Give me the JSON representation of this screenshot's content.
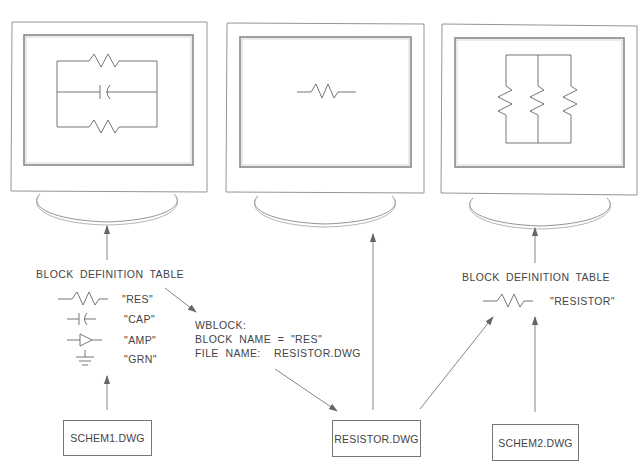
{
  "diagram": {
    "monitors": [
      {
        "id": "monitor-schem1",
        "screen_content": "parallel-circuit-2-resistors-1-capacitor"
      },
      {
        "id": "monitor-resistor",
        "screen_content": "single-resistor"
      },
      {
        "id": "monitor-schem2",
        "screen_content": "parallel-circuit-3-resistors"
      }
    ],
    "left_table": {
      "title": "BLOCK DEFINITION TABLE",
      "entries": [
        {
          "symbol": "resistor-icon",
          "name": "\"RES\""
        },
        {
          "symbol": "capacitor-icon",
          "name": "\"CAP\""
        },
        {
          "symbol": "amplifier-icon",
          "name": "\"AMP\""
        },
        {
          "symbol": "ground-icon",
          "name": "\"GRN\""
        }
      ]
    },
    "right_table": {
      "title": "BLOCK DEFINITION TABLE",
      "entries": [
        {
          "symbol": "resistor-icon",
          "name": "\"RESISTOR\""
        }
      ]
    },
    "wblock_note": {
      "line1": "WBLOCK:",
      "line2": "BLOCK  NAME  =  \"RES\"",
      "line3": "FILE  NAME:    RESISTOR.DWG"
    },
    "files": {
      "schem1": "SCHEM1.DWG",
      "resistor": "RESISTOR.DWG",
      "schem2": "SCHEM2.DWG"
    },
    "colors": {
      "line": "#777777",
      "text": "#444444",
      "arrowhead": "#666666",
      "background": "#ffffff"
    }
  }
}
